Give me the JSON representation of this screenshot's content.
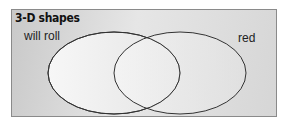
{
  "diagram": {
    "type": "venn",
    "title": "3-D shapes",
    "sets": [
      {
        "label": "will roll"
      },
      {
        "label": "red"
      }
    ],
    "colors": {
      "background": "#d8d8d8",
      "circle_fill": "#f2f2f2",
      "stroke": "#333333"
    }
  }
}
